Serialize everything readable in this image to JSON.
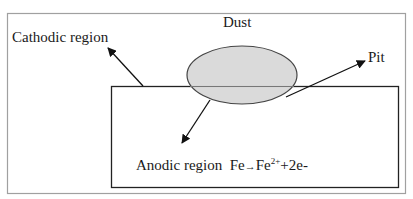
{
  "diagram": {
    "labels": {
      "dust": "Dust",
      "cathodic": "Cathodic region",
      "pit": "Pit",
      "anodic": "Anodic region",
      "reaction_fe": "Fe",
      "reaction_arrow": "→",
      "reaction_product": "Fe",
      "reaction_charge": "2+",
      "reaction_rest": "+2e-"
    },
    "colors": {
      "frame": "#a0a0a0",
      "metal_outline": "#222222",
      "dust_fill": "#d6d6d6",
      "dust_stroke": "#444444",
      "arrow": "#111111"
    }
  }
}
